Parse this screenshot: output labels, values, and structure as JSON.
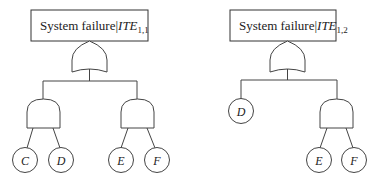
{
  "diagram": {
    "type": "fault-tree",
    "trees": [
      {
        "id": "tree-1",
        "top_event": {
          "prefix": "System failure|",
          "symbol": "ITE",
          "subscript": "1,1"
        },
        "top_gate": "OR",
        "children": [
          {
            "gate": "AND",
            "inputs": [
              "C",
              "D"
            ]
          },
          {
            "gate": "AND",
            "inputs": [
              "E",
              "F"
            ]
          }
        ]
      },
      {
        "id": "tree-2",
        "top_event": {
          "prefix": "System failure|",
          "symbol": "ITE",
          "subscript": "1,2"
        },
        "top_gate": "OR",
        "children": [
          {
            "basic_event": "D"
          },
          {
            "gate": "AND",
            "inputs": [
              "E",
              "F"
            ]
          }
        ]
      }
    ]
  },
  "labels": {
    "t1": {
      "prefix": "System failure|",
      "symbol": "ITE",
      "subscript": "1,1"
    },
    "t2": {
      "prefix": "System failure|",
      "symbol": "ITE",
      "subscript": "1,2"
    },
    "t1_and1_in1": "C",
    "t1_and1_in2": "D",
    "t1_and2_in1": "E",
    "t1_and2_in2": "F",
    "t2_basic": "D",
    "t2_and_in1": "E",
    "t2_and_in2": "F"
  }
}
